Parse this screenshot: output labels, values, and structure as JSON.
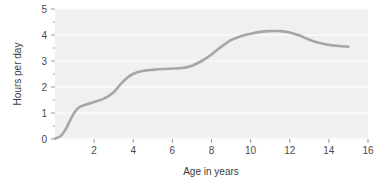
{
  "chart_data": {
    "type": "line",
    "title": "",
    "xlabel": "Age in years",
    "ylabel": "Hours per day",
    "xlim": [
      0,
      16
    ],
    "ylim": [
      0,
      5
    ],
    "grid": "horizontal-major-white",
    "legend": "none",
    "line_color": "#a6a6a6",
    "plot_background": "#f0f0f0",
    "xticks": [
      0,
      2,
      4,
      6,
      8,
      10,
      12,
      14,
      16
    ],
    "xtick_labels": [
      "",
      "2",
      "4",
      "6",
      "8",
      "10",
      "12",
      "14",
      "16"
    ],
    "xminor_ticks": [
      1,
      3,
      5,
      7,
      9,
      11,
      13,
      15
    ],
    "yticks": [
      0,
      1,
      2,
      3,
      4,
      5
    ],
    "ytick_labels": [
      "0",
      "1",
      "2",
      "3",
      "4",
      "5"
    ],
    "yminor_ticks": [
      0.5,
      1.5,
      2.5,
      3.5,
      4.5
    ],
    "x": [
      0,
      0.3,
      0.6,
      0.9,
      1.2,
      1.6,
      2.0,
      2.5,
      3.0,
      3.4,
      3.8,
      4.2,
      4.6,
      5.0,
      5.5,
      6.0,
      6.5,
      7.0,
      7.5,
      8.0,
      8.5,
      9.0,
      9.5,
      10.0,
      10.5,
      11.0,
      11.5,
      12.0,
      12.5,
      13.0,
      13.5,
      14.0,
      14.5,
      15.0
    ],
    "y": [
      0.02,
      0.12,
      0.45,
      0.9,
      1.2,
      1.33,
      1.42,
      1.55,
      1.8,
      2.15,
      2.42,
      2.57,
      2.63,
      2.66,
      2.69,
      2.71,
      2.73,
      2.82,
      3.0,
      3.25,
      3.55,
      3.8,
      3.95,
      4.05,
      4.12,
      4.15,
      4.15,
      4.1,
      3.98,
      3.82,
      3.7,
      3.62,
      3.58,
      3.55
    ]
  },
  "axes": {
    "y_title": "Hours per day",
    "x_title": "Age in years"
  }
}
